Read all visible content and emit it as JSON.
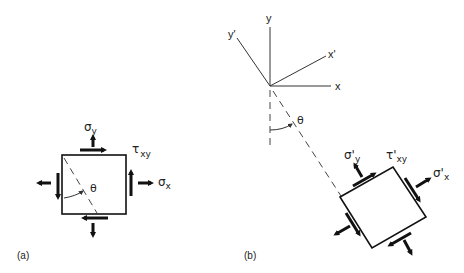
{
  "figure": {
    "panel_a": {
      "label": "(a)",
      "sigma_y": {
        "main": "σ",
        "sub": "y"
      },
      "tau_xy": {
        "main": "τ",
        "sub": "xy"
      },
      "sigma_x": {
        "main": "σ",
        "sub": "x"
      },
      "theta": "θ"
    },
    "panel_b": {
      "label": "(b)",
      "axes": {
        "x": "x",
        "y": "y",
        "x_prime": "x'",
        "y_prime": "y'"
      },
      "theta": "θ",
      "sigma_y_prime": {
        "main": "σ'",
        "sub": "y"
      },
      "tau_xy_prime": {
        "main": "τ'",
        "sub": "xy"
      },
      "sigma_x_prime": {
        "main": "σ'",
        "sub": "x"
      }
    }
  }
}
